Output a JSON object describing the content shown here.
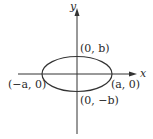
{
  "diagram": {
    "type": "ellipse-on-axes",
    "axes": {
      "x_label": "x",
      "y_label": "y"
    },
    "points": [
      {
        "id": "top",
        "label": "(0, b)"
      },
      {
        "id": "bottom",
        "label": "(0, −b)"
      },
      {
        "id": "left",
        "label": "(−a, 0)"
      },
      {
        "id": "right",
        "label": "(a, 0)"
      }
    ],
    "colors": {
      "stroke": "#333333",
      "text": "#2a2a2a",
      "background": "#ffffff"
    }
  }
}
